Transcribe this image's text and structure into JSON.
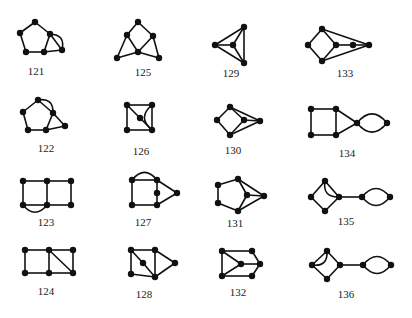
{
  "figure": {
    "vertex_radius": 3.2,
    "graphs": [
      {
        "id": "121",
        "label": "121",
        "label_pos": [
          36,
          75
        ],
        "vertices": [
          [
            35,
            22
          ],
          [
            20,
            33
          ],
          [
            26,
            52
          ],
          [
            44,
            52
          ],
          [
            50,
            34
          ],
          [
            62,
            50
          ]
        ],
        "edges": [
          [
            0,
            1
          ],
          [
            1,
            2
          ],
          [
            2,
            3
          ],
          [
            3,
            4
          ],
          [
            4,
            0
          ],
          [
            4,
            5
          ],
          [
            3,
            5
          ]
        ],
        "arcs": [
          [
            4,
            5,
            -1
          ]
        ]
      },
      {
        "id": "125",
        "label": "125",
        "label_pos": [
          143,
          76
        ],
        "vertices": [
          [
            138,
            22
          ],
          [
            127,
            35
          ],
          [
            153,
            36
          ],
          [
            138,
            52
          ],
          [
            117,
            58
          ],
          [
            159,
            58
          ]
        ],
        "edges": [
          [
            0,
            1
          ],
          [
            0,
            2
          ],
          [
            1,
            3
          ],
          [
            2,
            3
          ],
          [
            1,
            4
          ],
          [
            4,
            3
          ],
          [
            3,
            5
          ],
          [
            2,
            5
          ]
        ],
        "arcs": []
      },
      {
        "id": "129",
        "label": "129",
        "label_pos": [
          231,
          77
        ],
        "vertices": [
          [
            244,
            27
          ],
          [
            215,
            45
          ],
          [
            233,
            45
          ],
          [
            244,
            63
          ]
        ],
        "edges": [
          [
            0,
            1
          ],
          [
            1,
            3
          ],
          [
            0,
            3
          ],
          [
            1,
            2
          ],
          [
            2,
            0
          ],
          [
            2,
            3
          ]
        ],
        "arcs": []
      },
      {
        "id": "133",
        "label": "133",
        "label_pos": [
          345,
          77
        ],
        "vertices": [
          [
            322,
            29
          ],
          [
            308,
            45
          ],
          [
            336,
            45
          ],
          [
            322,
            61
          ],
          [
            353,
            45
          ],
          [
            369,
            45
          ]
        ],
        "edges": [
          [
            0,
            1
          ],
          [
            1,
            3
          ],
          [
            3,
            2
          ],
          [
            2,
            0
          ],
          [
            2,
            4
          ],
          [
            4,
            5
          ],
          [
            0,
            5
          ],
          [
            3,
            5
          ]
        ],
        "arcs": []
      },
      {
        "id": "122",
        "label": "122",
        "label_pos": [
          46,
          152
        ],
        "vertices": [
          [
            38,
            100
          ],
          [
            23,
            112
          ],
          [
            28,
            130
          ],
          [
            46,
            130
          ],
          [
            53,
            113
          ],
          [
            65,
            126
          ]
        ],
        "edges": [
          [
            0,
            1
          ],
          [
            1,
            2
          ],
          [
            2,
            3
          ],
          [
            3,
            4
          ],
          [
            4,
            0
          ],
          [
            4,
            5
          ],
          [
            3,
            5
          ]
        ],
        "arcs": [
          [
            0,
            4,
            -1
          ]
        ]
      },
      {
        "id": "126",
        "label": "126",
        "label_pos": [
          141,
          155
        ],
        "vertices": [
          [
            127,
            105
          ],
          [
            152,
            105
          ],
          [
            140,
            118
          ],
          [
            127,
            130
          ],
          [
            152,
            130
          ]
        ],
        "edges": [
          [
            0,
            1
          ],
          [
            0,
            3
          ],
          [
            3,
            4
          ],
          [
            1,
            4
          ],
          [
            0,
            2
          ],
          [
            2,
            4
          ]
        ],
        "arcs": [
          [
            1,
            4,
            1
          ]
        ]
      },
      {
        "id": "130",
        "label": "130",
        "label_pos": [
          233,
          154
        ],
        "vertices": [
          [
            230,
            107
          ],
          [
            217,
            120
          ],
          [
            244,
            120
          ],
          [
            230,
            135
          ],
          [
            260,
            121
          ]
        ],
        "edges": [
          [
            0,
            1
          ],
          [
            1,
            3
          ],
          [
            3,
            2
          ],
          [
            2,
            0
          ],
          [
            2,
            4
          ],
          [
            0,
            4
          ],
          [
            3,
            4
          ]
        ],
        "arcs": []
      },
      {
        "id": "134",
        "label": "134",
        "label_pos": [
          347,
          157
        ],
        "vertices": [
          [
            311,
            109
          ],
          [
            336,
            109
          ],
          [
            311,
            135
          ],
          [
            336,
            135
          ],
          [
            357,
            123
          ],
          [
            387,
            123
          ]
        ],
        "edges": [
          [
            0,
            1
          ],
          [
            0,
            2
          ],
          [
            2,
            3
          ],
          [
            1,
            3
          ],
          [
            1,
            4
          ],
          [
            3,
            4
          ]
        ],
        "arcs": [
          [
            4,
            5,
            -1
          ],
          [
            4,
            5,
            1
          ]
        ]
      },
      {
        "id": "123",
        "label": "123",
        "label_pos": [
          46,
          226
        ],
        "vertices": [
          [
            23,
            181
          ],
          [
            47,
            181
          ],
          [
            71,
            181
          ],
          [
            23,
            205
          ],
          [
            47,
            205
          ],
          [
            71,
            205
          ]
        ],
        "edges": [
          [
            0,
            1
          ],
          [
            1,
            2
          ],
          [
            0,
            3
          ],
          [
            1,
            4
          ],
          [
            2,
            5
          ],
          [
            3,
            4
          ],
          [
            4,
            5
          ]
        ],
        "arcs": [
          [
            3,
            4,
            1
          ]
        ]
      },
      {
        "id": "127",
        "label": "127",
        "label_pos": [
          143,
          226
        ],
        "vertices": [
          [
            132,
            180
          ],
          [
            157,
            180
          ],
          [
            157,
            193
          ],
          [
            132,
            205
          ],
          [
            157,
            205
          ],
          [
            177,
            193
          ]
        ],
        "edges": [
          [
            0,
            1
          ],
          [
            0,
            3
          ],
          [
            3,
            4
          ],
          [
            1,
            2
          ],
          [
            2,
            4
          ],
          [
            1,
            5
          ],
          [
            4,
            5
          ]
        ],
        "arcs": [
          [
            0,
            1,
            -1
          ]
        ]
      },
      {
        "id": "131",
        "label": "131",
        "label_pos": [
          235,
          227
        ],
        "vertices": [
          [
            218,
            185
          ],
          [
            238,
            179
          ],
          [
            247,
            195
          ],
          [
            218,
            203
          ],
          [
            238,
            211
          ],
          [
            264,
            196
          ]
        ],
        "edges": [
          [
            0,
            1
          ],
          [
            0,
            3
          ],
          [
            3,
            4
          ],
          [
            1,
            2
          ],
          [
            2,
            4
          ],
          [
            1,
            5
          ],
          [
            2,
            5
          ],
          [
            4,
            5
          ]
        ],
        "arcs": []
      },
      {
        "id": "135",
        "label": "135",
        "label_pos": [
          346,
          225
        ],
        "vertices": [
          [
            325,
            181
          ],
          [
            311,
            197
          ],
          [
            339,
            197
          ],
          [
            325,
            211
          ],
          [
            362,
            197
          ],
          [
            390,
            197
          ]
        ],
        "edges": [
          [
            0,
            1
          ],
          [
            1,
            3
          ],
          [
            3,
            2
          ],
          [
            2,
            0
          ],
          [
            2,
            4
          ]
        ],
        "arcs": [
          [
            0,
            2,
            1
          ],
          [
            4,
            5,
            -1
          ],
          [
            4,
            5,
            1
          ]
        ]
      },
      {
        "id": "124",
        "label": "124",
        "label_pos": [
          46,
          295
        ],
        "vertices": [
          [
            25,
            250
          ],
          [
            49,
            250
          ],
          [
            73,
            250
          ],
          [
            25,
            273
          ],
          [
            49,
            273
          ],
          [
            73,
            273
          ]
        ],
        "edges": [
          [
            0,
            1
          ],
          [
            1,
            2
          ],
          [
            0,
            3
          ],
          [
            1,
            4
          ],
          [
            2,
            5
          ],
          [
            3,
            4
          ],
          [
            4,
            5
          ],
          [
            1,
            5
          ]
        ],
        "arcs": []
      },
      {
        "id": "128",
        "label": "128",
        "label_pos": [
          144,
          298
        ],
        "vertices": [
          [
            131,
            250
          ],
          [
            155,
            250
          ],
          [
            143,
            263
          ],
          [
            131,
            274
          ],
          [
            155,
            277
          ],
          [
            175,
            263
          ]
        ],
        "edges": [
          [
            0,
            1
          ],
          [
            0,
            3
          ],
          [
            3,
            4
          ],
          [
            1,
            4
          ],
          [
            0,
            2
          ],
          [
            2,
            4
          ],
          [
            1,
            5
          ],
          [
            4,
            5
          ]
        ],
        "arcs": []
      },
      {
        "id": "132",
        "label": "132",
        "label_pos": [
          238,
          296
        ],
        "vertices": [
          [
            222,
            251
          ],
          [
            252,
            251
          ],
          [
            241,
            264
          ],
          [
            222,
            276
          ],
          [
            252,
            276
          ],
          [
            260,
            264
          ]
        ],
        "edges": [
          [
            0,
            1
          ],
          [
            0,
            3
          ],
          [
            3,
            4
          ],
          [
            0,
            2
          ],
          [
            3,
            2
          ],
          [
            2,
            5
          ],
          [
            1,
            5
          ],
          [
            4,
            5
          ]
        ],
        "arcs": []
      },
      {
        "id": "136",
        "label": "136",
        "label_pos": [
          346,
          298
        ],
        "vertices": [
          [
            327,
            251
          ],
          [
            312,
            265
          ],
          [
            340,
            265
          ],
          [
            327,
            279
          ],
          [
            363,
            265
          ],
          [
            391,
            265
          ]
        ],
        "edges": [
          [
            0,
            1
          ],
          [
            1,
            3
          ],
          [
            3,
            2
          ],
          [
            2,
            0
          ],
          [
            2,
            4
          ]
        ],
        "arcs": [
          [
            0,
            1,
            -1
          ],
          [
            4,
            5,
            -1
          ],
          [
            4,
            5,
            1
          ]
        ]
      }
    ]
  }
}
